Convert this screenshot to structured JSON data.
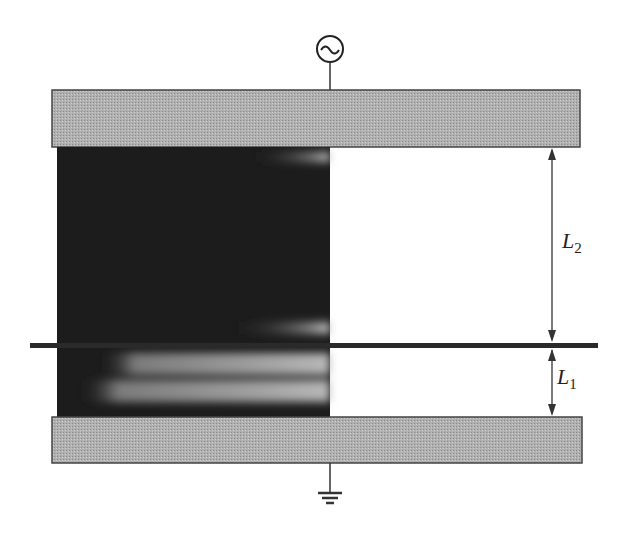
{
  "diagram": {
    "type": "electrode-gap-schematic",
    "source_symbol": "~",
    "labels": {
      "L2_main": "L",
      "L2_sub": "2",
      "L1_main": "L",
      "L1_sub": "1"
    },
    "colors": {
      "electrode": "#a8a8a8",
      "electrode_border": "#444444",
      "discharge_dark": "#1c1c1c",
      "discharge_light": "#b5b5b5",
      "midplate": "#2a2a2a",
      "line": "#333333"
    },
    "components": [
      "AC source (top)",
      "top electrode",
      "discharge region",
      "intermediate plate",
      "bottom electrode",
      "ground (bottom)",
      "dimension L2",
      "dimension L1"
    ]
  }
}
